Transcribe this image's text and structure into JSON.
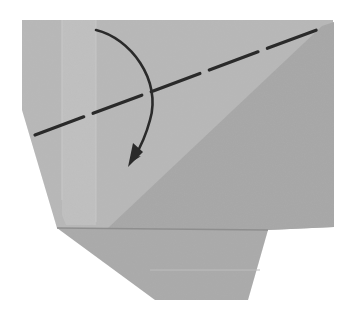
{
  "diagram": {
    "type": "origami-fold-step",
    "colors": {
      "background": "#ffffff",
      "paper_light": "#b9b9b9",
      "paper_mid": "#adadad",
      "paper_dark": "#9f9f9f",
      "crease_light": "#c6c6c6",
      "shelf_shadow": "#8e8e8e",
      "line": "#2a2a2a"
    },
    "elements": {
      "paper_outline": [
        [
          22,
          20
        ],
        [
          333,
          20
        ],
        [
          334,
          227
        ],
        [
          268,
          230
        ],
        [
          248,
          300
        ],
        [
          155,
          300
        ],
        [
          57,
          228
        ],
        [
          22,
          110
        ]
      ],
      "dark_region": [
        [
          322,
          26
        ],
        [
          334,
          26
        ],
        [
          334,
          227
        ],
        [
          268,
          230
        ],
        [
          110,
          228
        ]
      ],
      "lower_flap": [
        [
          57,
          228
        ],
        [
          268,
          230
        ],
        [
          248,
          300
        ],
        [
          155,
          300
        ]
      ],
      "vertical_creases": [
        {
          "x": 62,
          "y1": 20,
          "y2": 200
        },
        {
          "x": 80,
          "y1": 20,
          "y2": 220
        }
      ],
      "valley_fold_line": {
        "from": [
          35,
          135
        ],
        "to": [
          322,
          28
        ],
        "style": "dashed"
      },
      "fold_arrow": {
        "start": [
          96,
          30
        ],
        "end": [
          133,
          163
        ],
        "direction": "clockwise-down"
      }
    }
  }
}
